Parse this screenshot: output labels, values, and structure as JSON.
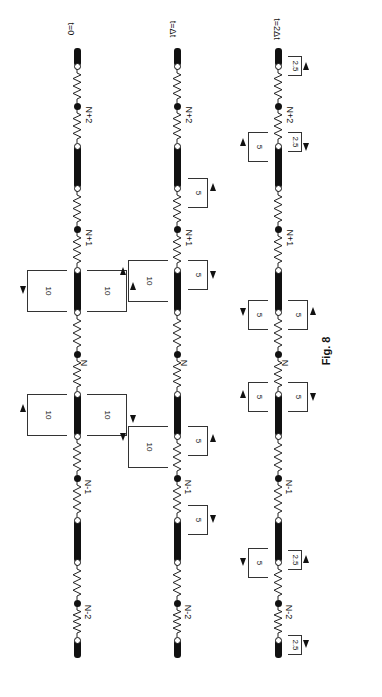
{
  "figure": {
    "caption": "Fig. 8",
    "orientation": "rotated 90 degrees"
  },
  "rows": [
    {
      "time_label": "t=0",
      "nodes": [
        "N+2",
        "N+1",
        "N",
        "N-1",
        "N-2"
      ],
      "pulses": [
        {
          "value": "10",
          "side": "left",
          "near_node": "N",
          "position": "between N+1 and N",
          "direction": "down"
        },
        {
          "value": "10",
          "side": "right",
          "near_node": "N",
          "position": "between N+1 and N",
          "direction": "up"
        },
        {
          "value": "10",
          "side": "left",
          "near_node": "N",
          "position": "between N and N-1",
          "direction": "up"
        },
        {
          "value": "10",
          "side": "right",
          "near_node": "N",
          "position": "between N and N-1",
          "direction": "down"
        }
      ]
    },
    {
      "time_label": "t=Δt",
      "nodes": [
        "N+2",
        "N+1",
        "N",
        "N-1",
        "N-2"
      ],
      "pulses": [
        {
          "value": "5",
          "side": "right",
          "position": "between N+2 and N+1",
          "direction": "up"
        },
        {
          "value": "10",
          "side": "left",
          "position": "between N+1 and N",
          "direction": "up"
        },
        {
          "value": "5",
          "side": "right",
          "position": "between N+1 and N",
          "direction": "down"
        },
        {
          "value": "10",
          "side": "left",
          "position": "between N and N-1",
          "direction": "down"
        },
        {
          "value": "5",
          "side": "right",
          "position": "between N and N-1",
          "direction": "up"
        },
        {
          "value": "5",
          "side": "right",
          "position": "between N-1 and N-2",
          "direction": "down"
        }
      ]
    },
    {
      "time_label": "t=2Δt",
      "nodes": [
        "N+2",
        "N+1",
        "N",
        "N-1",
        "N-2"
      ],
      "pulses": [
        {
          "value": "2.5",
          "side": "right",
          "position": "top end",
          "direction": "up"
        },
        {
          "value": "5",
          "side": "left",
          "position": "between N+2 and N+1",
          "direction": "up"
        },
        {
          "value": "2.5",
          "side": "right",
          "position": "between N+2 and N+1",
          "direction": "down"
        },
        {
          "value": "5",
          "side": "left",
          "position": "between N+1 and N",
          "direction": "down"
        },
        {
          "value": "5",
          "side": "right",
          "position": "between N+1 and N",
          "direction": "up"
        },
        {
          "value": "5",
          "side": "left",
          "position": "between N and N-1",
          "direction": "up"
        },
        {
          "value": "5",
          "side": "right",
          "position": "between N and N-1",
          "direction": "down"
        },
        {
          "value": "5",
          "side": "left",
          "position": "between N-1 and N-2",
          "direction": "down"
        },
        {
          "value": "2.5",
          "side": "right",
          "position": "between N-1 and N-2",
          "direction": "up"
        },
        {
          "value": "2.5",
          "side": "right",
          "position": "bottom end",
          "direction": "down"
        }
      ]
    }
  ]
}
